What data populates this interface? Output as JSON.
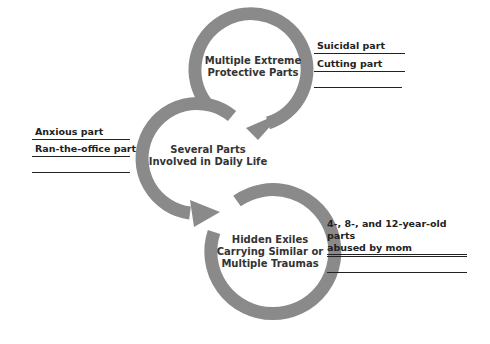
{
  "diagram": {
    "arrow_color": "#8a8a8a",
    "nodes": [
      {
        "id": "protectors",
        "label_lines": [
          "Multiple Extreme",
          "Protective Parts"
        ],
        "annotations": [
          "Suicidal part",
          "Cutting part",
          ""
        ]
      },
      {
        "id": "managers",
        "label_lines": [
          "Several Parts",
          "Involved in Daily Life"
        ],
        "annotations": [
          "Anxious part",
          "Ran-the-office part",
          ""
        ]
      },
      {
        "id": "exiles",
        "label_lines": [
          "Hidden Exiles",
          "Carrying Similar or",
          "Multiple Traumas"
        ],
        "annotations": [
          "4-, 8-, and 12-year-old parts abused by mom",
          "",
          ""
        ],
        "annotation_lines": [
          "4-, 8-, and 12-year-old parts",
          "abused by mom"
        ]
      }
    ]
  }
}
